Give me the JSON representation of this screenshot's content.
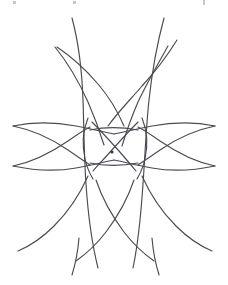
{
  "figure": {
    "kind": "knot-diagram",
    "title": "",
    "caption": "",
    "background_color": "#ffffff",
    "stroke_color": "#4a4a52",
    "basepoint_color": "#3a3a42",
    "width": 228,
    "height": 285
  },
  "basepoint": {
    "label": "",
    "x": 112,
    "y": 152,
    "radius": 1.6
  },
  "crop_ticks": [
    {
      "x": 13,
      "y": 1,
      "width": 3,
      "height": 3
    },
    {
      "x": 73,
      "y": 1,
      "width": 3,
      "height": 3
    },
    {
      "x": 203,
      "y": 0,
      "width": 2,
      "height": 5
    }
  ],
  "strands": [
    {
      "name": "vertical-left-outer",
      "d": "M 72 18 C 79 44, 82 72, 83 100 C 84 128, 84 156, 86 184 C 88 214, 92 244, 98 268"
    },
    {
      "name": "vertical-right-outer",
      "d": "M 164 18 C 157 44, 152 72, 149 100 C 146 128, 145 156, 143 184 C 141 214, 138 244, 133 268"
    },
    {
      "name": "vertical-left-inner-upper",
      "d": "M 57 47 C 72 57, 86 70, 98 84 C 110 98, 118 112, 124 126"
    },
    {
      "name": "vertical-right-inner-upper",
      "d": "M 177 40 C 167 56, 155 72, 142 86 C 130 100, 118 112, 108 126"
    },
    {
      "name": "upper-left-arc",
      "d": "M 55 47 C 68 63, 79 82, 88 102 C 95 118, 100 132, 104 145"
    },
    {
      "name": "upper-right-arc",
      "d": "M 168 46 C 158 64, 147 83, 138 102 C 131 118, 126 133, 122 146"
    },
    {
      "name": "horizontal-top-left",
      "d": "M 13 126 C 32 122, 54 122, 76 126 C 92 129, 104 132, 114 134"
    },
    {
      "name": "horizontal-top-right",
      "d": "M 215 126 C 196 122, 174 122, 152 126 C 136 129, 124 132, 114 134"
    },
    {
      "name": "horizontal-bottom-left",
      "d": "M 13 166 C 32 170, 54 172, 76 168 C 92 165, 104 162, 114 160"
    },
    {
      "name": "horizontal-bottom-right",
      "d": "M 215 166 C 196 170, 174 172, 152 168 C 136 165, 124 162, 114 160"
    },
    {
      "name": "left-wing-upper",
      "d": "M 13 126 C 33 130, 52 139, 68 150 C 78 157, 84 161, 90 165"
    },
    {
      "name": "left-wing-lower",
      "d": "M 13 166 C 33 162, 52 152, 68 141 C 78 134, 84 130, 90 127"
    },
    {
      "name": "right-wing-upper",
      "d": "M 215 126 C 195 130, 176 139, 160 150 C 150 157, 144 161, 138 165"
    },
    {
      "name": "right-wing-lower",
      "d": "M 215 166 C 195 162, 176 152, 160 141 C 150 134, 144 130, 138 127"
    },
    {
      "name": "center-diag-nw-se",
      "d": "M 92 122 C 101 131, 110 141, 119 151 C 126 159, 131 165, 136 171"
    },
    {
      "name": "center-diag-ne-sw",
      "d": "M 138 122 C 129 131, 120 141, 111 151 C 104 159, 98 165, 93 171"
    },
    {
      "name": "center-box-left",
      "d": "M 88 118 C 83 130, 82 145, 85 159 C 87 168, 90 174, 93 179"
    },
    {
      "name": "center-box-right",
      "d": "M 142 118 C 147 130, 148 145, 145 159 C 143 168, 140 174, 137 179"
    },
    {
      "name": "center-chord-upper",
      "d": "M 90 130 C 104 127, 122 127, 138 130"
    },
    {
      "name": "center-chord-lower",
      "d": "M 90 163 C 104 166, 122 166, 138 163"
    },
    {
      "name": "lower-left-leg-inner",
      "d": "M 96 180 C 102 198, 112 216, 124 232 C 134 245, 144 254, 154 261"
    },
    {
      "name": "lower-right-leg-inner",
      "d": "M 134 180 C 128 198, 118 216, 106 232 C 96 245, 86 254, 76 261"
    },
    {
      "name": "lower-left-sweep",
      "d": "M 88 176 C 80 194, 68 212, 54 226 C 42 238, 30 246, 18 251"
    },
    {
      "name": "lower-right-sweep",
      "d": "M 142 176 C 150 194, 162 212, 176 226 C 188 238, 200 246, 212 251"
    },
    {
      "name": "bottom-left-tail",
      "d": "M 79 238 C 78 250, 76 262, 72 275"
    },
    {
      "name": "bottom-right-tail",
      "d": "M 152 238 C 153 250, 155 262, 159 275"
    }
  ]
}
